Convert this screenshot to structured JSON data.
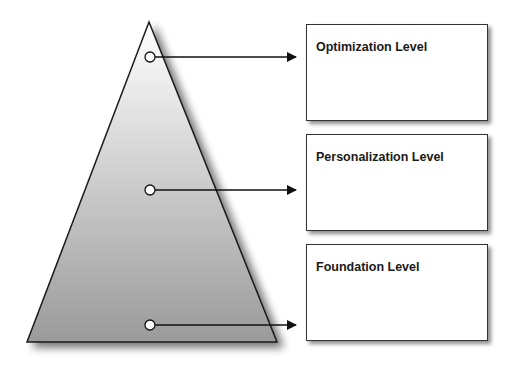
{
  "diagram": {
    "type": "pyramid-levels",
    "levels": [
      {
        "label": "Optimization Level",
        "position": "top"
      },
      {
        "label": "Personalization Level",
        "position": "middle"
      },
      {
        "label": "Foundation Level",
        "position": "bottom"
      }
    ],
    "colors": {
      "pyramid_top": "#ffffff",
      "pyramid_bottom": "#9a9a9a",
      "stroke": "#1a1a1a",
      "box_border": "#333333"
    }
  }
}
